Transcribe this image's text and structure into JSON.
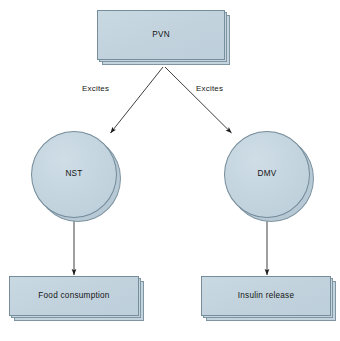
{
  "diagram": {
    "background_color": "#ffffff",
    "node_fill_color": "#c3d4de",
    "node_border_color": "#768d9b",
    "arrow_color": "#1c1c1c",
    "text_color": "#141414",
    "nodes": [
      {
        "id": "pvn",
        "label": "PVN",
        "shape": "process-box"
      },
      {
        "id": "nst",
        "label": "NST",
        "shape": "circle"
      },
      {
        "id": "dmv",
        "label": "DMV",
        "shape": "circle"
      },
      {
        "id": "food",
        "label": "Food consumption",
        "shape": "process-box"
      },
      {
        "id": "ins",
        "label": "Insulin release",
        "shape": "process-box"
      }
    ],
    "edges": [
      {
        "id": "pvn-nst",
        "from": "PVN",
        "to": "NST",
        "label": "Excites"
      },
      {
        "id": "pvn-dmv",
        "from": "PVN",
        "to": "DMV",
        "label": "Excites"
      },
      {
        "id": "nst-food",
        "from": "NST",
        "to": "Food consumption",
        "label": ""
      },
      {
        "id": "dmv-ins",
        "from": "DMV",
        "to": "Insulin release",
        "label": ""
      }
    ]
  }
}
